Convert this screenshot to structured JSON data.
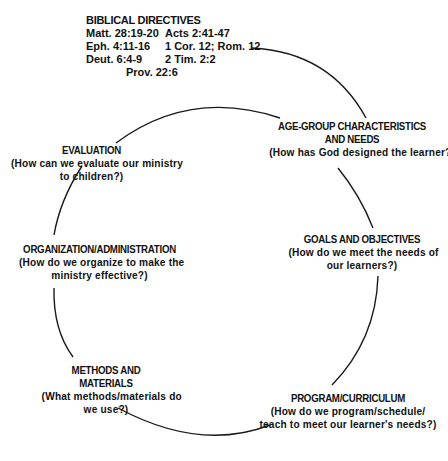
{
  "biblical_directives": {
    "title": "BIBLICAL DIRECTIVES",
    "rows": [
      {
        "left": "Matt. 28:19-20",
        "right": "Acts 2:41-47"
      },
      {
        "left": "Eph. 4:11-16",
        "right": "1 Cor. 12; Rom. 12"
      },
      {
        "left": "Deut. 6:4-9",
        "right": "2 Tim. 2:2"
      }
    ],
    "last": "Prov. 22:6"
  },
  "nodes": {
    "age_group": {
      "title1": "AGE-GROUP CHARACTERISTICS",
      "title2": "AND NEEDS",
      "q1": "(How has God designed the learner?)"
    },
    "goals": {
      "title1": "GOALS AND OBJECTIVES",
      "q1": "(How do we meet the needs of",
      "q2": "our learners?)"
    },
    "program": {
      "title1": "PROGRAM/CURRICULUM",
      "q1": "(How do we program/schedule/",
      "q2": "teach to meet our learner's needs?)"
    },
    "methods": {
      "title1": "METHODS AND MATERIALS",
      "q1": "(What methods/materials do",
      "q2": "we use?)"
    },
    "organization": {
      "title1": "ORGANIZATION/ADMINISTRATION",
      "q1": "(How do we organize to make the",
      "q2": "ministry effective?)"
    },
    "evaluation": {
      "title1": "EVALUATION",
      "q1": "(How can we evaluate our ministry",
      "q2": "to children?)"
    }
  },
  "colors": {
    "line": "#1a1a1a",
    "text": "#111111",
    "background": "#ffffff"
  }
}
